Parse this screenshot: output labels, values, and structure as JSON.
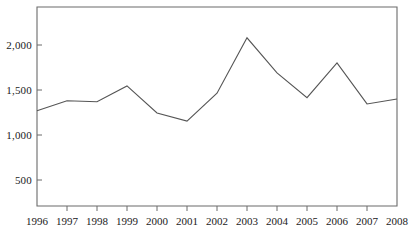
{
  "chart_data": {
    "type": "line",
    "title": "",
    "subtitle": "",
    "xlabel": "",
    "ylabel": "",
    "categories": [
      "1996",
      "1997",
      "1998",
      "1999",
      "2000",
      "2001",
      "2002",
      "2003",
      "2004",
      "2005",
      "2006",
      "2007",
      "2008"
    ],
    "x": [
      1996,
      1997,
      1998,
      1999,
      2000,
      2001,
      2002,
      2003,
      2004,
      2005,
      2006,
      2007,
      2008
    ],
    "values": [
      1270,
      1380,
      1370,
      1545,
      1245,
      1155,
      1465,
      2080,
      1690,
      1415,
      1800,
      1345,
      1400
    ],
    "series": [
      {
        "name": "",
        "values": [
          1270,
          1380,
          1370,
          1545,
          1245,
          1155,
          1465,
          2080,
          1690,
          1415,
          1800,
          1345,
          1400
        ]
      }
    ],
    "xlim": [
      1996,
      2008
    ],
    "ylim": [
      0,
      2300
    ],
    "yticks": [
      500,
      1000,
      1500,
      2000
    ],
    "ytick_labels": [
      "500",
      "1,000",
      "1,500",
      "2,000"
    ],
    "xticks": [
      1996,
      1997,
      1998,
      1999,
      2000,
      2001,
      2002,
      2003,
      2004,
      2005,
      2006,
      2007,
      2008
    ],
    "xtick_labels": [
      "1996",
      "1997",
      "1998",
      "1999",
      "2000",
      "2001",
      "2002",
      "2003",
      "2004",
      "2005",
      "2006",
      "2007",
      "2008"
    ],
    "grid": false,
    "legend": false,
    "legend_position": "none",
    "line_color": "#555555",
    "axis_color": "#6b6b6b",
    "background_color": "#ffffff",
    "annotations": []
  }
}
